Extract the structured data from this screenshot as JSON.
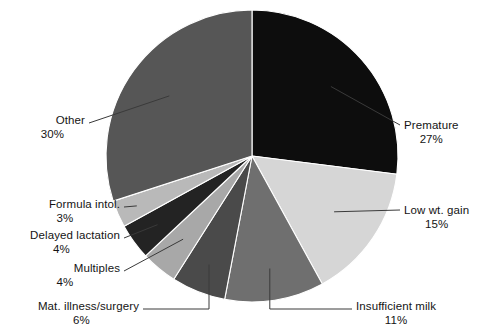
{
  "chart_data": {
    "type": "pie",
    "title": "",
    "subtitle": "",
    "xlabel": "",
    "ylabel": "",
    "legend_position": "none",
    "grid": false,
    "units": "percent",
    "start_angle_deg": 0,
    "direction": "clockwise",
    "categories": [
      "Premature",
      "Low wt. gain",
      "Insufficient milk",
      "Mat. illness/surgery",
      "Multiples",
      "Delayed lactation",
      "Formula intol.",
      "Other"
    ],
    "values": [
      27,
      15,
      11,
      6,
      4,
      4,
      3,
      30
    ],
    "value_labels": [
      "27%",
      "15%",
      "11%",
      "6%",
      "4%",
      "4%",
      "3%",
      "30%"
    ],
    "colors": [
      "#0d0d0d",
      "#d6d6d6",
      "#6f6f6f",
      "#4a4a4a",
      "#a8a8a8",
      "#232323",
      "#b9b9b9",
      "#565656"
    ],
    "slices": [
      {
        "label": "Premature",
        "value": 27,
        "value_label": "27%",
        "color": "#0d0d0d",
        "label_position": "right"
      },
      {
        "label": "Low wt. gain",
        "value": 15,
        "value_label": "15%",
        "color": "#d6d6d6",
        "label_position": "right"
      },
      {
        "label": "Insufficient milk",
        "value": 11,
        "value_label": "11%",
        "color": "#6f6f6f",
        "label_position": "below-right"
      },
      {
        "label": "Mat. illness/surgery",
        "value": 6,
        "value_label": "6%",
        "color": "#4a4a4a",
        "label_position": "below-left"
      },
      {
        "label": "Multiples",
        "value": 4,
        "value_label": "4%",
        "color": "#a8a8a8",
        "label_position": "left"
      },
      {
        "label": "Delayed lactation",
        "value": 4,
        "value_label": "4%",
        "color": "#232323",
        "label_position": "left"
      },
      {
        "label": "Formula intol.",
        "value": 3,
        "value_label": "3%",
        "color": "#b9b9b9",
        "label_position": "left"
      },
      {
        "label": "Other",
        "value": 30,
        "value_label": "30%",
        "color": "#565656",
        "label_position": "left"
      }
    ]
  },
  "callouts": {
    "premature": {
      "label": "Premature",
      "percent": "27%"
    },
    "low_wt_gain": {
      "label": "Low wt. gain",
      "percent": "15%"
    },
    "insufficient_milk": {
      "label": "Insufficient milk",
      "percent": "11%"
    },
    "mat_illness": {
      "label": "Mat. illness/surgery",
      "percent": "6%"
    },
    "multiples": {
      "label": "Multiples",
      "percent": "4%"
    },
    "delayed_lactation": {
      "label": "Delayed lactation",
      "percent": "4%"
    },
    "formula_intol": {
      "label": "Formula intol.",
      "percent": "3%"
    },
    "other": {
      "label": "Other",
      "percent": "30%"
    }
  },
  "style": {
    "background": "#ffffff",
    "leader_line_color": "#3a3a3a",
    "text_color": "#141414"
  }
}
